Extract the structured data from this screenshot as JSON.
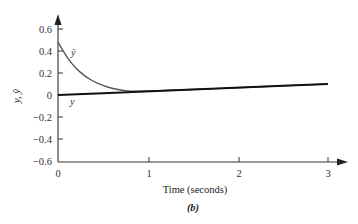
{
  "chart_data": {
    "type": "line",
    "title": "",
    "caption": "(b)",
    "xlabel": "Time (seconds)",
    "ylabel": "y, ŷ",
    "xlim": [
      0,
      3
    ],
    "ylim": [
      -0.6,
      0.6
    ],
    "x_ticks": [
      0,
      1,
      2,
      3
    ],
    "x_tick_labels": [
      "0",
      "1",
      "2",
      "3"
    ],
    "y_ticks": [
      0.6,
      0.4,
      0.2,
      0,
      -0.2,
      -0.4,
      -0.6
    ],
    "y_tick_labels": [
      "0.6",
      "0.4",
      "0.2",
      "0",
      "−0.2",
      "−0.4",
      "−0.6"
    ],
    "grid": false,
    "legend": "inline labels",
    "series": [
      {
        "name": "ŷ",
        "label": "ŷ",
        "color": "#555555",
        "x": [
          0,
          0.1,
          0.2,
          0.3,
          0.4,
          0.5,
          0.6,
          0.7,
          0.8,
          1.0,
          1.5,
          2.0,
          2.5,
          3.0
        ],
        "values": [
          0.48,
          0.34,
          0.24,
          0.17,
          0.12,
          0.085,
          0.06,
          0.045,
          0.035,
          0.035,
          0.05,
          0.067,
          0.083,
          0.1
        ]
      },
      {
        "name": "y",
        "label": "y",
        "color": "#111111",
        "x": [
          0,
          1,
          2,
          3
        ],
        "values": [
          0,
          0.033,
          0.067,
          0.1
        ]
      }
    ]
  },
  "labels": {
    "yhat": "ŷ",
    "y": "y",
    "ylabel": "y, ŷ",
    "xlabel": "Time (seconds)",
    "caption": "(b)",
    "xt0": "0",
    "xt1": "1",
    "xt2": "2",
    "xt3": "3",
    "yt06": "0.6",
    "yt04": "0.4",
    "yt02": "0.2",
    "yt0": "0",
    "ytm02": "−0.2",
    "ytm04": "−0.4",
    "ytm06": "−0.6"
  }
}
